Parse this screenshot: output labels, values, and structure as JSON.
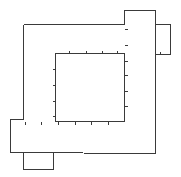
{
  "diagram": {
    "width": 181,
    "height": 177,
    "background": "#ffffff",
    "stroke": "#3a3a3a",
    "outer_outline": {
      "points": [
        [
          23,
          24
        ],
        [
          124,
          24
        ],
        [
          124,
          10
        ],
        [
          155,
          10
        ],
        [
          155,
          153
        ],
        [
          10,
          152
        ],
        [
          10,
          119
        ],
        [
          23,
          119
        ],
        [
          23,
          24
        ]
      ]
    },
    "inner_square": {
      "x": 55,
      "y": 53,
      "width": 69,
      "height": 68
    },
    "right_tab": {
      "x": 155,
      "y": 24,
      "width": 15,
      "height": 30
    },
    "bottom_tab": {
      "x": 23,
      "y": 152,
      "width": 30,
      "height": 17
    },
    "ticks": {
      "inner_top": {
        "y": 53,
        "x": [
          69,
          86,
          102,
          117
        ],
        "direction": "up",
        "length": 3
      },
      "inner_left": {
        "x": 55,
        "y": [
          69,
          85,
          101,
          116
        ],
        "direction": "left",
        "length": 3
      },
      "inner_right": {
        "x": 124,
        "y": [
          29,
          45,
          61,
          75,
          91,
          106
        ],
        "direction": "right",
        "length": 3
      },
      "inner_bottom": {
        "y": 121,
        "x": [
          25,
          41,
          58,
          75,
          91,
          108
        ],
        "direction": "down",
        "length": 3
      },
      "right_tab_bottom": {
        "y": 54,
        "x": [
          160
        ],
        "direction": "up",
        "length": 3
      }
    }
  }
}
